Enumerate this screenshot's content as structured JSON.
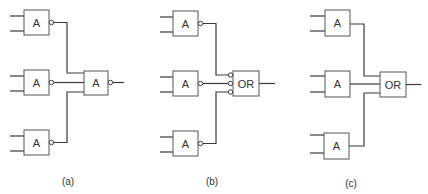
{
  "diagrams": [
    {
      "id": "a",
      "caption": "(a)",
      "input_gates": [
        {
          "label": "A",
          "inverted_output": true
        },
        {
          "label": "A",
          "inverted_output": true
        },
        {
          "label": "A",
          "inverted_output": true
        }
      ],
      "output_gate": {
        "label": "A",
        "inverted_output": true,
        "inverted_inputs": false
      }
    },
    {
      "id": "b",
      "caption": "(b)",
      "input_gates": [
        {
          "label": "A",
          "inverted_output": true
        },
        {
          "label": "A",
          "inverted_output": true
        },
        {
          "label": "A",
          "inverted_output": true
        }
      ],
      "output_gate": {
        "label": "OR",
        "inverted_output": false,
        "inverted_inputs": true
      }
    },
    {
      "id": "c",
      "caption": "(c)",
      "input_gates": [
        {
          "label": "A",
          "inverted_output": false
        },
        {
          "label": "A",
          "inverted_output": false
        },
        {
          "label": "A",
          "inverted_output": false
        }
      ],
      "output_gate": {
        "label": "OR",
        "inverted_output": false,
        "inverted_inputs": false
      }
    }
  ]
}
